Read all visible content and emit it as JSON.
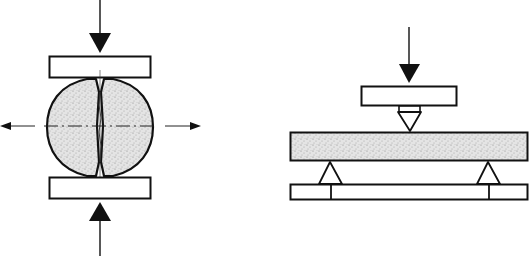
{
  "diagram": {
    "type": "mechanical test schematics",
    "panels": [
      {
        "id": "left",
        "name": "Brazilian disc (diametral compression / splitting tensile) test",
        "elements": [
          "top loading arrow (downward)",
          "top platen",
          "cylindrical specimen split along vertical diameter",
          "bottom platen",
          "bottom loading arrow (upward)",
          "horizontal dashed axis with outward tensile arrows"
        ]
      },
      {
        "id": "right",
        "name": "Three-point bending (flexural) test",
        "elements": [
          "loading arrow (downward)",
          "loading platen",
          "wedge indenter",
          "beam specimen",
          "two triangular supports",
          "support base"
        ]
      }
    ],
    "colors": {
      "stroke": "#111111",
      "fill_specimen": "#dcdcdc",
      "background": "#ffffff"
    }
  }
}
